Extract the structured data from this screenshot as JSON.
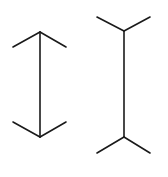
{
  "figure": {
    "type": "muller-lyer-illusion",
    "background": "#ffffff",
    "stroke_color": "#1a1a1a",
    "left": {
      "shaft": {
        "x": 40,
        "y1": 32,
        "y2": 137
      },
      "fins": "inward-arrowheads",
      "top_fins": [
        {
          "x": 13,
          "y": 47
        },
        {
          "x": 66,
          "y": 47
        }
      ],
      "bottom_fins": [
        {
          "x": 13,
          "y": 122
        },
        {
          "x": 66,
          "y": 122
        }
      ]
    },
    "right": {
      "shaft": {
        "x": 124,
        "y1": 31,
        "y2": 137
      },
      "fins": "outward-tails",
      "top_fins": [
        {
          "x": 97,
          "y": 17
        },
        {
          "x": 150,
          "y": 17
        }
      ],
      "bottom_fins": [
        {
          "x": 97,
          "y": 153
        },
        {
          "x": 150,
          "y": 153
        }
      ]
    }
  }
}
